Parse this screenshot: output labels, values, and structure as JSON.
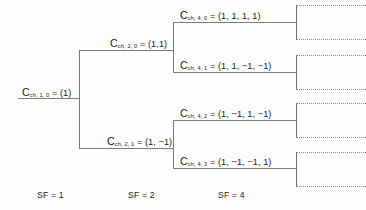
{
  "diagram": {
    "line_color": "#7b7b7b",
    "box_border_color": "#8d8d8d",
    "text_color": "#1b1b1b",
    "background": "#fdfdfb"
  },
  "nodes": {
    "root": {
      "symbol": "C",
      "subscript": "ch, 1, 0",
      "equals": "= (1)",
      "full": "C_ch,1,0 = (1)",
      "sf": 1
    },
    "level2": [
      {
        "symbol": "C",
        "subscript": "ch, 2, 0",
        "equals": "= (1,1)",
        "full": "C_ch,2,0 = (1,1)",
        "sf": 2
      },
      {
        "symbol": "C",
        "subscript": "ch, 2, 1",
        "equals": "= (1, −1)",
        "full": "C_ch,2,1 = (1, -1)",
        "sf": 2
      }
    ],
    "level4": [
      {
        "symbol": "C",
        "subscript": "ch, 4, 0",
        "equals": "= (1, 1, 1, 1)",
        "full": "C_ch,4,0 = (1, 1, 1, 1)",
        "sf": 4
      },
      {
        "symbol": "C",
        "subscript": "ch, 4, 1",
        "equals": "= (1, 1, −1, −1)",
        "full": "C_ch,4,1 = (1, 1, -1, -1)",
        "sf": 4
      },
      {
        "symbol": "C",
        "subscript": "ch, 4, 2",
        "equals": "= (1, −1, 1, −1)",
        "full": "C_ch,4,2 = (1, -1, 1, -1)",
        "sf": 4
      },
      {
        "symbol": "C",
        "subscript": "ch, 4, 3",
        "equals": "= (1, −1, −1, 1)",
        "full": "C_ch,4,3 = (1, −1, −1, 1)",
        "sf": 4
      }
    ]
  },
  "sf_captions": [
    {
      "label": "SF = 1"
    },
    {
      "label": "SF = 2"
    },
    {
      "label": "SF = 4"
    }
  ],
  "continuation_boxes": [
    {
      "index": 0
    },
    {
      "index": 1
    },
    {
      "index": 2
    },
    {
      "index": 3
    }
  ]
}
